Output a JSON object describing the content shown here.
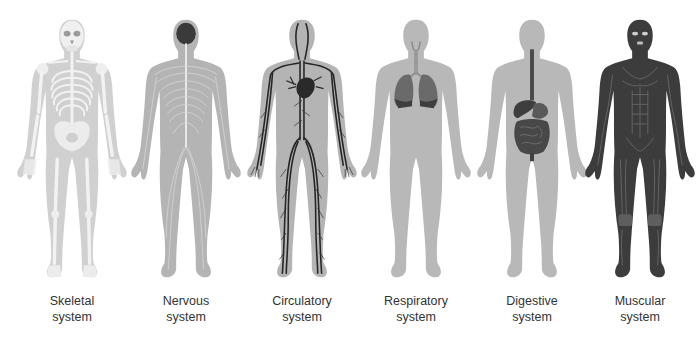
{
  "colors": {
    "body_fill": "#b8b8b8",
    "skeleton_body_fill": "#d2d2d2",
    "bone": "#f2f2f2",
    "nerve": "#e6e6e6",
    "brain": "#3a3a3a",
    "vessel": "#2a2a2a",
    "lung": "#5a5a5a",
    "organ": "#4a4a4a",
    "muscle": "#3c3c3c",
    "muscle_line": "#707070",
    "caption_text": "#333333"
  },
  "systems": [
    {
      "id": "skeletal",
      "line1": "Skeletal",
      "line2": "system",
      "center_x": 72
    },
    {
      "id": "nervous",
      "line1": "Nervous",
      "line2": "system",
      "center_x": 186
    },
    {
      "id": "circulatory",
      "line1": "Circulatory",
      "line2": "system",
      "center_x": 302
    },
    {
      "id": "respiratory",
      "line1": "Respiratory",
      "line2": "system",
      "center_x": 416
    },
    {
      "id": "digestive",
      "line1": "Digestive",
      "line2": "system",
      "center_x": 532
    },
    {
      "id": "muscular",
      "line1": "Muscular",
      "line2": "system",
      "center_x": 640
    }
  ]
}
